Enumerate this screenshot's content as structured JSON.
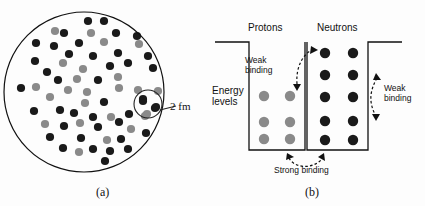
{
  "figure": {
    "colors": {
      "background": "#fdfdfd",
      "dark_nucleon": "#1a1a1a",
      "gray_nucleon": "#8a8a8a",
      "gray_nucleon_edge": "#6e6e6e",
      "line": "#111111"
    }
  },
  "panel_a": {
    "caption": "(a)",
    "scale_label": "2 fm",
    "boundary": {
      "cx": 84,
      "cy": 92,
      "r": 80
    },
    "callout": {
      "cx": 148,
      "cy": 104,
      "r": 14
    },
    "nucleons": [
      {
        "x": 88,
        "y": 21,
        "type": "dark"
      },
      {
        "x": 104,
        "y": 21,
        "type": "dark"
      },
      {
        "x": 55,
        "y": 31,
        "type": "gray"
      },
      {
        "x": 64,
        "y": 33,
        "type": "dark"
      },
      {
        "x": 91,
        "y": 33,
        "type": "gray"
      },
      {
        "x": 116,
        "y": 33,
        "type": "dark"
      },
      {
        "x": 137,
        "y": 36,
        "type": "dark"
      },
      {
        "x": 36,
        "y": 43,
        "type": "dark"
      },
      {
        "x": 54,
        "y": 46,
        "type": "dark"
      },
      {
        "x": 79,
        "y": 43,
        "type": "dark"
      },
      {
        "x": 104,
        "y": 42,
        "type": "gray"
      },
      {
        "x": 139,
        "y": 44,
        "type": "gray"
      },
      {
        "x": 69,
        "y": 54,
        "type": "dark"
      },
      {
        "x": 93,
        "y": 56,
        "type": "dark"
      },
      {
        "x": 118,
        "y": 53,
        "type": "dark"
      },
      {
        "x": 148,
        "y": 56,
        "type": "dark"
      },
      {
        "x": 35,
        "y": 61,
        "type": "dark"
      },
      {
        "x": 47,
        "y": 72,
        "type": "dark"
      },
      {
        "x": 63,
        "y": 63,
        "type": "gray"
      },
      {
        "x": 83,
        "y": 69,
        "type": "gray"
      },
      {
        "x": 110,
        "y": 66,
        "type": "dark"
      },
      {
        "x": 128,
        "y": 63,
        "type": "dark"
      },
      {
        "x": 153,
        "y": 68,
        "type": "dark"
      },
      {
        "x": 58,
        "y": 80,
        "type": "dark"
      },
      {
        "x": 77,
        "y": 79,
        "type": "gray"
      },
      {
        "x": 98,
        "y": 80,
        "type": "dark"
      },
      {
        "x": 118,
        "y": 77,
        "type": "gray"
      },
      {
        "x": 21,
        "y": 88,
        "type": "dark"
      },
      {
        "x": 36,
        "y": 87,
        "type": "gray"
      },
      {
        "x": 68,
        "y": 90,
        "type": "gray"
      },
      {
        "x": 87,
        "y": 92,
        "type": "gray"
      },
      {
        "x": 119,
        "y": 88,
        "type": "gray"
      },
      {
        "x": 138,
        "y": 90,
        "type": "gray"
      },
      {
        "x": 158,
        "y": 91,
        "type": "gray"
      },
      {
        "x": 50,
        "y": 97,
        "type": "gray"
      },
      {
        "x": 85,
        "y": 103,
        "type": "gray"
      },
      {
        "x": 104,
        "y": 102,
        "type": "dark"
      },
      {
        "x": 143,
        "y": 99,
        "type": "dark"
      },
      {
        "x": 155,
        "y": 108,
        "type": "dark"
      },
      {
        "x": 34,
        "y": 111,
        "type": "dark"
      },
      {
        "x": 60,
        "y": 110,
        "type": "dark"
      },
      {
        "x": 74,
        "y": 113,
        "type": "dark"
      },
      {
        "x": 93,
        "y": 117,
        "type": "dark"
      },
      {
        "x": 111,
        "y": 117,
        "type": "gray"
      },
      {
        "x": 129,
        "y": 114,
        "type": "dark"
      },
      {
        "x": 145,
        "y": 116,
        "type": "gray"
      },
      {
        "x": 45,
        "y": 124,
        "type": "gray"
      },
      {
        "x": 64,
        "y": 126,
        "type": "dark"
      },
      {
        "x": 80,
        "y": 123,
        "type": "gray"
      },
      {
        "x": 98,
        "y": 127,
        "type": "dark"
      },
      {
        "x": 119,
        "y": 122,
        "type": "dark"
      },
      {
        "x": 131,
        "y": 129,
        "type": "gray"
      },
      {
        "x": 146,
        "y": 133,
        "type": "dark"
      },
      {
        "x": 50,
        "y": 137,
        "type": "dark"
      },
      {
        "x": 81,
        "y": 138,
        "type": "dark"
      },
      {
        "x": 107,
        "y": 140,
        "type": "gray"
      },
      {
        "x": 121,
        "y": 139,
        "type": "dark"
      },
      {
        "x": 63,
        "y": 148,
        "type": "dark"
      },
      {
        "x": 79,
        "y": 152,
        "type": "gray"
      },
      {
        "x": 93,
        "y": 149,
        "type": "dark"
      },
      {
        "x": 110,
        "y": 151,
        "type": "dark"
      },
      {
        "x": 128,
        "y": 149,
        "type": "dark"
      },
      {
        "x": 105,
        "y": 161,
        "type": "dark"
      },
      {
        "x": 143,
        "y": 101,
        "type": "dark"
      },
      {
        "x": 156,
        "y": 107,
        "type": "dark"
      },
      {
        "x": 147,
        "y": 114,
        "type": "gray"
      }
    ]
  },
  "panel_b": {
    "caption": "(b)",
    "protons_label": "Protons",
    "neutrons_label": "Neutrons",
    "energy_levels_label": "Energy\nlevels",
    "weak_binding_left": "Weak\nbinding",
    "weak_binding_right": "Weak\nbinding",
    "strong_binding_label": "Strong binding",
    "proton_well": {
      "left": 37,
      "right": 93,
      "top": 42,
      "bottom": 150,
      "level_rows": [
        96,
        122,
        139
      ],
      "columns": [
        52,
        78
      ],
      "count": 6,
      "dot_type": "gray"
    },
    "neutron_well": {
      "left": 95,
      "right": 156,
      "top": 42,
      "bottom": 150,
      "level_rows": [
        53,
        75,
        97,
        121,
        140
      ],
      "columns": [
        113,
        141
      ],
      "count": 10,
      "dot_type": "dark"
    }
  }
}
